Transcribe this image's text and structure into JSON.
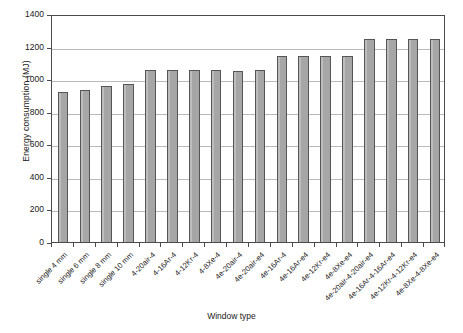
{
  "chart_data": {
    "type": "bar",
    "title": "",
    "xlabel": "Window type",
    "ylabel": "Energy consumption (MJ)",
    "ylim": [
      0,
      1400
    ],
    "ytick_values": [
      0,
      200,
      400,
      600,
      800,
      1000,
      1200,
      1400
    ],
    "ytick_labels": [
      "0",
      "200",
      "400",
      "600",
      "800",
      "1000",
      "1200",
      "1400"
    ],
    "grid": "horizontal",
    "legend": "none",
    "bar_color": "#a6a6a6",
    "bar_edge_color": "#555555",
    "axis_color": "#4a4a4a",
    "gridline_color": "#b9b9b9",
    "categories": [
      "single 4 mm",
      "single 6 mm",
      "single 8 mm",
      "single 10 mm",
      "4-20air-4",
      "4-16Ar-4",
      "4-12Kr-4",
      "4-8Xe-4",
      "4e-20air-4",
      "4e-20air-e4",
      "4e-16Ar-4",
      "4e-16Ar-e4",
      "4e-12Kr-e4",
      "4e-8Xe-e4",
      "4e-20air-4-20air-e4",
      "4e-16Ar-4-16Ar-e4",
      "4e-12Kr-4-12Kr-e4",
      "4e-8Xe-4-8Xe-e4"
    ],
    "values": [
      920,
      935,
      958,
      970,
      1057,
      1057,
      1057,
      1057,
      1053,
      1055,
      1140,
      1140,
      1140,
      1140,
      1245,
      1245,
      1245,
      1245
    ]
  }
}
